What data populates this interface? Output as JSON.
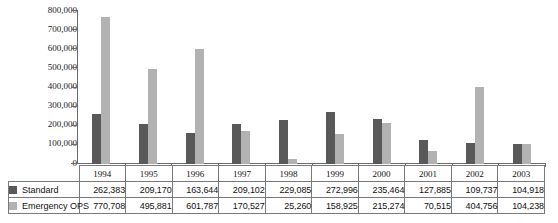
{
  "chart_data": {
    "type": "bar",
    "title": "",
    "xlabel": "",
    "ylabel": "",
    "ylim": [
      0,
      800000
    ],
    "grid": false,
    "legend_position": "table-left",
    "categories": [
      "1994",
      "1995",
      "1996",
      "1997",
      "1998",
      "1999",
      "2000",
      "2001",
      "2002",
      "2003"
    ],
    "ytick_labels": [
      "800,000",
      "700,000",
      "600,000",
      "500,000",
      "400,000",
      "300,000",
      "200,000",
      "100,000",
      "0"
    ],
    "ytick_values": [
      800000,
      700000,
      600000,
      500000,
      400000,
      300000,
      200000,
      100000,
      0
    ],
    "series": [
      {
        "name": "Standard",
        "color": "#595959",
        "values": [
          262383,
          209170,
          163644,
          209102,
          229085,
          272996,
          235464,
          127885,
          109737,
          104918
        ],
        "labels": [
          "262,383",
          "209,170",
          "163,644",
          "209,102",
          "229,085",
          "272,996",
          "235,464",
          "127,885",
          "109,737",
          "104,918"
        ]
      },
      {
        "name": "Emergency OPS",
        "color": "#b2b2b2",
        "values": [
          770708,
          495881,
          601787,
          170527,
          25260,
          158925,
          215274,
          70515,
          404756,
          104238
        ],
        "labels": [
          "770,708",
          "495,881",
          "601,787",
          "170,527",
          "25,260",
          "158,925",
          "215,274",
          "70,515",
          "404,756",
          "104,238"
        ]
      }
    ]
  },
  "colors": {
    "standard": "#595959",
    "emergency": "#b2b2b2",
    "axis": "#6b6b6b",
    "table_border": "#7a7a7a",
    "background": "#ffffff"
  }
}
